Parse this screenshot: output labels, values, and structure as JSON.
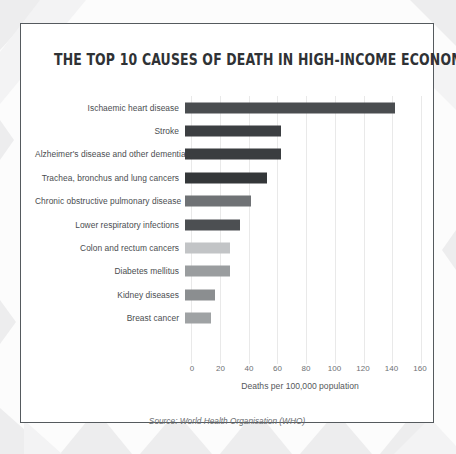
{
  "card": {
    "title": "THE TOP 10 CAUSES OF DEATH IN HIGH-INCOME ECONOMIES 2015",
    "source_note": "Source: World Health Organisation (WHO)",
    "border_color": "#555a5e",
    "background_color": "#ffffff"
  },
  "chart_data": {
    "type": "bar",
    "orientation": "horizontal",
    "title": "THE TOP 10 CAUSES OF DEATH IN HIGH-INCOME ECONOMIES 2015",
    "xlabel": "Deaths per 100,000 population",
    "ylabel": "",
    "xlim": [
      0,
      160
    ],
    "xticks": [
      0,
      20,
      40,
      60,
      80,
      100,
      120,
      140,
      160
    ],
    "grid": true,
    "legend": "none",
    "categories": [
      "Ischaemic heart disease",
      "Stroke",
      "Alzheimer's disease and other dementias",
      "Trachea, bronchus and lung cancers",
      "Chronic obstructive pulmonary disease",
      "Lower respiratory infections",
      "Colon and rectum cancers",
      "Diabetes mellitus",
      "Kidney diseases",
      "Breast cancer"
    ],
    "values": [
      146,
      67,
      67,
      57,
      46,
      38,
      31,
      31,
      21,
      18
    ],
    "bar_colors": [
      "#4a4d50",
      "#3c3f42",
      "#3a3d40",
      "#343739",
      "#6f7275",
      "#4c4f52",
      "#c2c4c6",
      "#9a9d9f",
      "#8b8e90",
      "#9fa2a4"
    ]
  },
  "axis": {
    "tick_color": "#6e7174",
    "gridline_color": "#e9e9e9"
  },
  "background": {
    "base_color": "#fcfcfc",
    "accent_color": "#ededee"
  }
}
